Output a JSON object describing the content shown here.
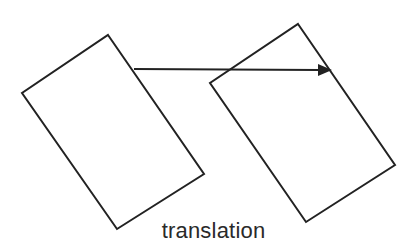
{
  "caption": "translation",
  "colors": {
    "stroke": "#222222",
    "background": "#ffffff",
    "text": "#2a2a2a"
  },
  "shapes": {
    "original_rectangle": {
      "points": "108,35 204,174 117,229 22,93"
    },
    "translated_rectangle": {
      "points": "298,24 395,165 306,222 210,83"
    },
    "arrow": {
      "x1": 134,
      "y1": 69,
      "x2": 320,
      "y2": 70,
      "head": "332,70 318,64 318,76"
    }
  }
}
